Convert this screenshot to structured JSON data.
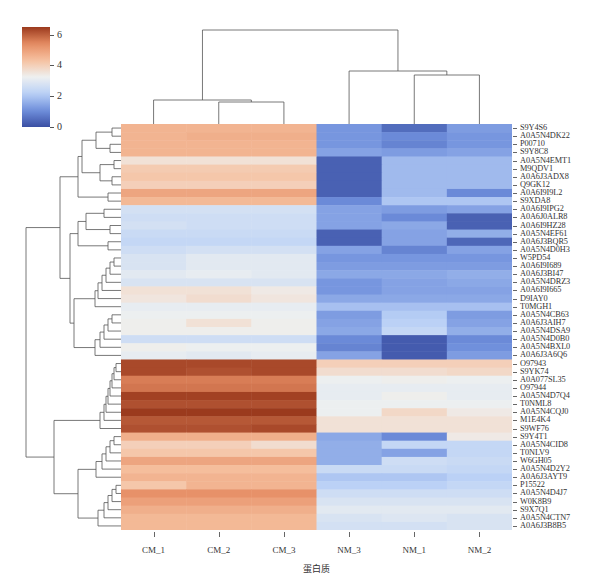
{
  "chart_data": {
    "type": "heatmap",
    "title": "",
    "xlabel": "蛋白质",
    "ylabel": "",
    "columns": [
      "CM_1",
      "CM_2",
      "CM_3",
      "NM_3",
      "NM_1",
      "NM_2"
    ],
    "rows": [
      "S9Y4S6",
      "A0A5N4DK22",
      "P00710",
      "S9Y8C8",
      "A0A5N4EMT1",
      "M9QDV1",
      "A0A6J3ADX8",
      "Q9GK12",
      "A0A6I9I9L2",
      "S9XDA8",
      "A0A6I9IPG2",
      "A0A6J0ALR8",
      "A0A6I9HZ28",
      "A0A5N4EF61",
      "A0A6J3BQR5",
      "A0A5N4D0H3",
      "W5PD54",
      "A0A6I9I689",
      "A0A6J3BI47",
      "A0A5N4DRZ3",
      "A0A6I9I665",
      "D9IAY0",
      "T0MGH1",
      "A0A5N4CB63",
      "A0A6J3AIH7",
      "A0A5N4DSA9",
      "A0A5N4D0B0",
      "A0A5N4BXL0",
      "A0A6J3A6Q6",
      "O97943",
      "S9YK74",
      "A0A077SL35",
      "O97944",
      "A0A5N4D7Q4",
      "T0NML8",
      "A0A5N4CQJ0",
      "M1E4K4",
      "S9WF76",
      "S9Y4T1",
      "A0A5N4CID8",
      "T0NLV9",
      "W6GH05",
      "A0A5N4D2Y2",
      "A0A6J3AYT9",
      "P15522",
      "A0A5N4D4J7",
      "W0K8B9",
      "S9X7Q1",
      "A0A5N4CTN7",
      "A0A6J3B8B5"
    ],
    "values": [
      [
        4.6,
        4.6,
        4.6,
        1.2,
        0.5,
        1.3
      ],
      [
        4.6,
        4.7,
        4.7,
        1.2,
        1.0,
        1.2
      ],
      [
        4.6,
        4.6,
        4.6,
        1.2,
        0.9,
        1.2
      ],
      [
        4.6,
        4.6,
        4.6,
        1.4,
        1.3,
        1.4
      ],
      [
        3.6,
        3.6,
        3.6,
        0.3,
        1.8,
        1.8
      ],
      [
        4.1,
        4.1,
        4.1,
        0.3,
        1.8,
        1.8
      ],
      [
        4.2,
        4.2,
        4.2,
        0.3,
        1.8,
        1.8
      ],
      [
        4.0,
        4.0,
        4.0,
        0.3,
        1.8,
        1.8
      ],
      [
        4.9,
        4.9,
        4.9,
        0.3,
        1.8,
        1.0
      ],
      [
        4.5,
        4.5,
        4.5,
        1.0,
        2.0,
        2.0
      ],
      [
        2.7,
        2.7,
        2.7,
        1.4,
        1.3,
        1.4
      ],
      [
        2.6,
        2.6,
        2.6,
        1.4,
        1.0,
        0.3
      ],
      [
        2.7,
        2.6,
        2.6,
        1.4,
        1.5,
        0.3
      ],
      [
        2.5,
        2.5,
        2.5,
        0.3,
        1.4,
        1.6
      ],
      [
        2.4,
        2.4,
        2.4,
        0.3,
        1.4,
        0.4
      ],
      [
        2.6,
        2.7,
        2.7,
        1.4,
        0.9,
        1.4
      ],
      [
        2.8,
        3.0,
        3.0,
        1.2,
        1.2,
        1.2
      ],
      [
        2.8,
        3.0,
        3.0,
        1.3,
        1.3,
        1.3
      ],
      [
        3.0,
        3.1,
        3.0,
        1.5,
        1.5,
        1.6
      ],
      [
        2.8,
        2.8,
        2.8,
        1.2,
        1.4,
        1.5
      ],
      [
        3.6,
        3.6,
        3.4,
        1.2,
        1.4,
        1.4
      ],
      [
        3.5,
        3.7,
        3.5,
        1.5,
        1.5,
        1.5
      ],
      [
        3.1,
        3.1,
        3.1,
        1.9,
        1.9,
        1.9
      ],
      [
        3.2,
        3.2,
        3.2,
        1.3,
        2.1,
        1.3
      ],
      [
        3.3,
        3.6,
        3.3,
        1.4,
        2.2,
        1.4
      ],
      [
        3.3,
        3.3,
        3.3,
        1.5,
        2.4,
        1.6
      ],
      [
        2.6,
        2.6,
        2.6,
        1.0,
        0.2,
        1.0
      ],
      [
        3.3,
        3.2,
        3.2,
        0.9,
        0.2,
        1.1
      ],
      [
        3.1,
        3.0,
        3.1,
        1.4,
        0.2,
        1.3
      ],
      [
        6.3,
        6.3,
        6.3,
        4.0,
        4.0,
        4.0
      ],
      [
        6.3,
        6.2,
        6.3,
        3.7,
        3.7,
        3.8
      ],
      [
        5.6,
        5.6,
        5.6,
        3.2,
        3.3,
        3.2
      ],
      [
        5.7,
        5.7,
        5.7,
        3.1,
        3.1,
        3.1
      ],
      [
        6.4,
        6.4,
        6.4,
        3.1,
        3.3,
        3.1
      ],
      [
        6.2,
        6.2,
        6.2,
        3.2,
        3.2,
        3.2
      ],
      [
        6.5,
        6.5,
        6.5,
        3.2,
        3.8,
        3.4
      ],
      [
        6.1,
        6.1,
        6.1,
        3.6,
        3.6,
        3.6
      ],
      [
        6.2,
        6.2,
        6.3,
        3.6,
        3.6,
        3.6
      ],
      [
        4.7,
        4.7,
        4.7,
        1.5,
        1.0,
        3.4
      ],
      [
        4.0,
        4.0,
        3.7,
        1.6,
        2.4,
        2.4
      ],
      [
        4.2,
        4.2,
        4.2,
        1.6,
        1.4,
        2.4
      ],
      [
        4.9,
        4.9,
        4.9,
        1.6,
        2.6,
        2.5
      ],
      [
        4.4,
        4.4,
        4.4,
        2.5,
        2.5,
        2.4
      ],
      [
        4.6,
        4.6,
        4.6,
        2.0,
        2.0,
        2.2
      ],
      [
        4.2,
        4.6,
        4.6,
        2.2,
        2.2,
        2.4
      ],
      [
        5.3,
        5.3,
        5.3,
        2.6,
        2.6,
        2.6
      ],
      [
        5.0,
        5.0,
        5.0,
        2.8,
        2.8,
        2.8
      ],
      [
        4.7,
        4.7,
        4.7,
        3.0,
        3.0,
        3.0
      ],
      [
        4.5,
        4.5,
        4.5,
        2.8,
        2.9,
        2.8
      ],
      [
        4.5,
        4.5,
        4.5,
        2.7,
        2.7,
        2.8
      ]
    ],
    "colorbar": {
      "min": 0,
      "max": 6.5,
      "ticks": [
        0,
        2,
        4,
        6
      ]
    },
    "colormap": [
      "#3a4fa3",
      "#6f8fdc",
      "#b9d0f6",
      "#eef0f0",
      "#f6c1a0",
      "#e58b62",
      "#9b3a1d"
    ],
    "column_dendrogram": "((CM_1,(CM_2,CM_3)),(NM_3,(NM_1,NM_2)))",
    "legend_position": "top-left"
  }
}
